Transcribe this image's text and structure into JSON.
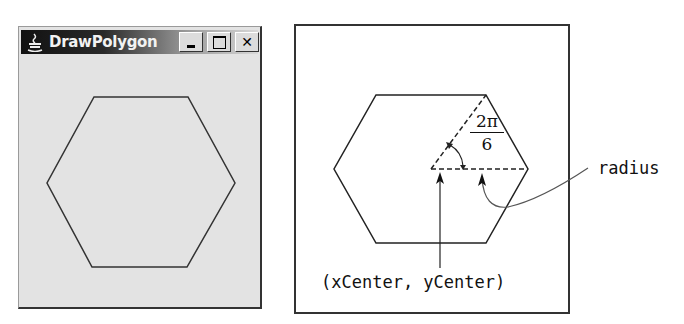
{
  "window": {
    "title": "DrawPolygon",
    "icon": "java-cup-icon",
    "buttons": {
      "minimize": "minimize",
      "maximize": "maximize",
      "close": "✕"
    },
    "polygon": {
      "shape": "hexagon",
      "sides": 6,
      "vertices": [
        [
          94,
          97
        ],
        [
          188,
          97
        ],
        [
          235,
          183
        ],
        [
          187,
          267
        ],
        [
          92,
          267
        ],
        [
          47,
          183
        ]
      ]
    }
  },
  "diagram": {
    "polygon": {
      "shape": "hexagon",
      "vertices": [
        [
          376,
          95
        ],
        [
          486,
          95
        ],
        [
          528,
          169
        ],
        [
          486,
          243
        ],
        [
          376,
          243
        ],
        [
          334,
          169
        ]
      ],
      "center": [
        431,
        169
      ]
    },
    "angle_label": {
      "numerator": "2π",
      "denominator": "6"
    },
    "radius_label": "radius",
    "center_label": "(xCenter, yCenter)"
  }
}
